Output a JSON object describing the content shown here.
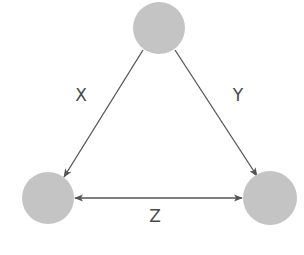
{
  "diagram": {
    "type": "triangle-relationship",
    "colors": {
      "node_fill": "#c4c4c4",
      "edge_stroke": "#555555",
      "label_color": "#4a4a4a",
      "background": "#ffffff"
    },
    "nodes": [
      {
        "id": "top",
        "label": "",
        "cx": 159,
        "cy": 28,
        "r": 26
      },
      {
        "id": "bottom-left",
        "label": "",
        "cx": 48,
        "cy": 198,
        "r": 26
      },
      {
        "id": "bottom-right",
        "label": "",
        "cx": 270,
        "cy": 198,
        "r": 27
      }
    ],
    "edges": [
      {
        "id": "x",
        "label": "X",
        "from": "top",
        "to": "bottom-left",
        "direction": "forward"
      },
      {
        "id": "y",
        "label": "Y",
        "from": "top",
        "to": "bottom-right",
        "direction": "forward"
      },
      {
        "id": "z",
        "label": "Z",
        "from": "bottom-left",
        "to": "bottom-right",
        "direction": "both"
      }
    ]
  }
}
